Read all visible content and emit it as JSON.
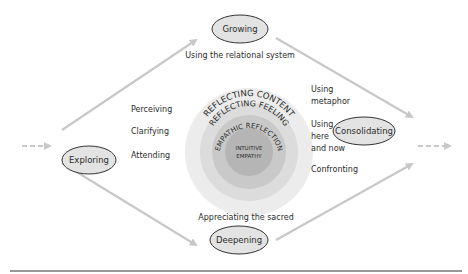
{
  "nodes": {
    "exploring": "Exploring",
    "growing": "Growing",
    "consolidating": "Consolidating",
    "deepening": "Deepening"
  },
  "labels": {
    "relational": "Using the relational system",
    "perceiving": "Perceiving",
    "clarifying": "Clarifying",
    "attending": "Attending",
    "metaphor_1": "Using",
    "metaphor_2": "metaphor",
    "herenow_1": "Using",
    "herenow_2": "here",
    "herenow_3": "and now",
    "confronting": "Confronting",
    "sacred": "Appreciating the sacred"
  },
  "rings": {
    "content": "REFLECTING CONTENT",
    "feeling": "REFLECTING FEELING",
    "empathic": "EMPATHIC REFLECTION",
    "intuitive_1": "INTUITIVE",
    "intuitive_2": "EMPATHY"
  },
  "colors": {
    "ring_outer": "#ececec",
    "ring_2": "#dcdcdc",
    "ring_3": "#c9c9c9",
    "ring_core": "#b5b5b5",
    "arrow": "#c8c8c8",
    "node_fill": "#e3e3e3"
  }
}
